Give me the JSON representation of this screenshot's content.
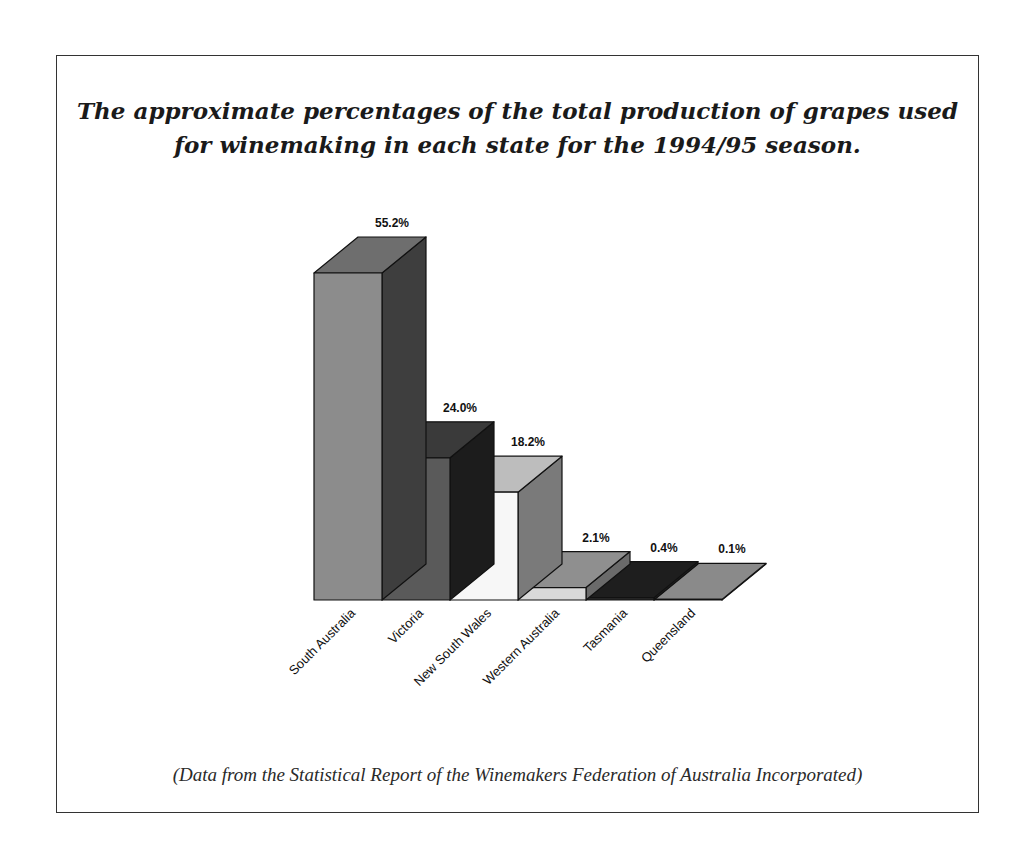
{
  "title": {
    "line1": "The approximate percentages of the total production of grapes used",
    "line2": "for winemaking in each state for the 1994/95 season."
  },
  "caption": "(Data from the Statistical Report of the Winemakers Federation of Australia Incorporated)",
  "chart_data": {
    "type": "bar",
    "style": "3d-column",
    "title": "The approximate percentages of the total production of grapes used for winemaking in each state for the 1994/95 season.",
    "xlabel": "",
    "ylabel": "",
    "grid": false,
    "legend": null,
    "categories": [
      "South Australia",
      "Victoria",
      "New South Wales",
      "Western Australia",
      "Tasmania",
      "Queensland"
    ],
    "values": [
      55.2,
      24.0,
      18.2,
      2.1,
      0.4,
      0.1
    ],
    "value_labels": [
      "55.2%",
      "24.0%",
      "18.2%",
      "2.1%",
      "0.4%",
      "0.1%"
    ],
    "unit": "%",
    "ylim": [
      0,
      60
    ],
    "colors": {
      "front": [
        "#8c8c8c",
        "#5a5a5a",
        "#f7f7f7",
        "#d9d9d9",
        "#2b2b2b",
        "#8a8a8a"
      ],
      "top": [
        "#6e6e6e",
        "#3a3a3a",
        "#bdbdbd",
        "#8f8f8f",
        "#1e1e1e",
        "#8a8a8a"
      ],
      "side": [
        "#3e3e3e",
        "#1c1c1c",
        "#7a7a7a",
        "#6a6a6a",
        "#222222",
        "#6e6e6e"
      ]
    },
    "annotation": "(Data from the Statistical Report of the Winemakers Federation of Australia Incorporated)"
  }
}
